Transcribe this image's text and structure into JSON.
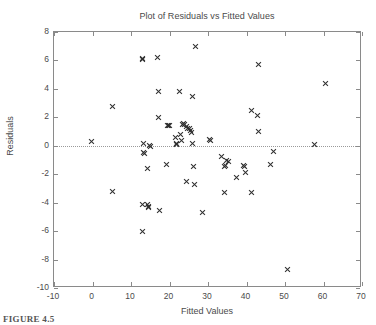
{
  "caption": "FIGURE 4.5",
  "chart_data": {
    "type": "scatter",
    "title": "Plot of Residuals vs Fitted Values",
    "xlabel": "Fitted Values",
    "ylabel": "Residuals",
    "xlim": [
      -10,
      70
    ],
    "ylim": [
      -10,
      8
    ],
    "xticks": [
      -10,
      0,
      10,
      20,
      30,
      40,
      50,
      60,
      70
    ],
    "xticklabels": [
      "-10",
      "0",
      "10",
      "20",
      "30",
      "40",
      "50",
      "60",
      "70"
    ],
    "yticks": [
      8,
      6,
      4,
      2,
      0,
      -2,
      -4,
      -6,
      -8,
      -10
    ],
    "yticklabels": [
      "8",
      "6",
      "4",
      "2",
      "0",
      "-2",
      "-4",
      "-6",
      "-8",
      "-10"
    ],
    "grid": false,
    "legend": null,
    "marker": "x",
    "marker_color": "#2e2e2e",
    "reference_line": {
      "type": "horizontal",
      "y": 0,
      "style": "dotted",
      "color": "#9a9a9a"
    },
    "series": [
      {
        "name": "Residuals",
        "points": [
          [
            -0.2,
            0.3
          ],
          [
            5.2,
            2.75
          ],
          [
            5.3,
            -3.2
          ],
          [
            12.9,
            6.15
          ],
          [
            13.1,
            6.1
          ],
          [
            13.2,
            0.15
          ],
          [
            13.3,
            -0.45
          ],
          [
            13.4,
            -0.55
          ],
          [
            12.9,
            -4.15
          ],
          [
            13.0,
            -6.0
          ],
          [
            14.3,
            -4.1
          ],
          [
            14.5,
            -4.25
          ],
          [
            14.6,
            -4.35
          ],
          [
            14.8,
            0.0
          ],
          [
            14.4,
            -1.6
          ],
          [
            15.0,
            -0.05
          ],
          [
            16.9,
            6.2
          ],
          [
            17.1,
            3.85
          ],
          [
            17.2,
            2.0
          ],
          [
            17.5,
            -4.55
          ],
          [
            19.4,
            1.45
          ],
          [
            19.8,
            1.45
          ],
          [
            20.0,
            1.4
          ],
          [
            19.3,
            -1.3
          ],
          [
            21.6,
            0.6
          ],
          [
            21.7,
            0.15
          ],
          [
            21.9,
            0.1
          ],
          [
            22.6,
            3.8
          ],
          [
            22.8,
            0.8
          ],
          [
            23.0,
            0.35
          ],
          [
            23.3,
            1.5
          ],
          [
            23.7,
            1.55
          ],
          [
            23.9,
            1.5
          ],
          [
            24.3,
            1.35
          ],
          [
            24.6,
            1.25
          ],
          [
            24.4,
            -2.5
          ],
          [
            25.1,
            1.2
          ],
          [
            25.4,
            1.1
          ],
          [
            25.7,
            0.95
          ],
          [
            26.0,
            3.5
          ],
          [
            26.1,
            0.15
          ],
          [
            26.2,
            -1.45
          ],
          [
            26.5,
            -2.75
          ],
          [
            26.7,
            6.95
          ],
          [
            28.7,
            -4.7
          ],
          [
            30.3,
            0.45
          ],
          [
            30.6,
            0.4
          ],
          [
            33.5,
            -0.75
          ],
          [
            34.2,
            -3.3
          ],
          [
            34.3,
            -1.45
          ],
          [
            34.6,
            -1.4
          ],
          [
            34.9,
            -1.05
          ],
          [
            35.2,
            -1.1
          ],
          [
            37.3,
            -2.2
          ],
          [
            39.2,
            -1.4
          ],
          [
            39.5,
            -1.45
          ],
          [
            39.8,
            -1.85
          ],
          [
            41.2,
            2.5
          ],
          [
            41.3,
            -3.3
          ],
          [
            42.8,
            2.1
          ],
          [
            43.0,
            1.0
          ],
          [
            43.2,
            5.7
          ],
          [
            46.3,
            -1.35
          ],
          [
            46.9,
            -0.4
          ],
          [
            50.6,
            -8.7
          ],
          [
            57.7,
            0.1
          ],
          [
            60.6,
            4.4
          ]
        ]
      }
    ]
  }
}
